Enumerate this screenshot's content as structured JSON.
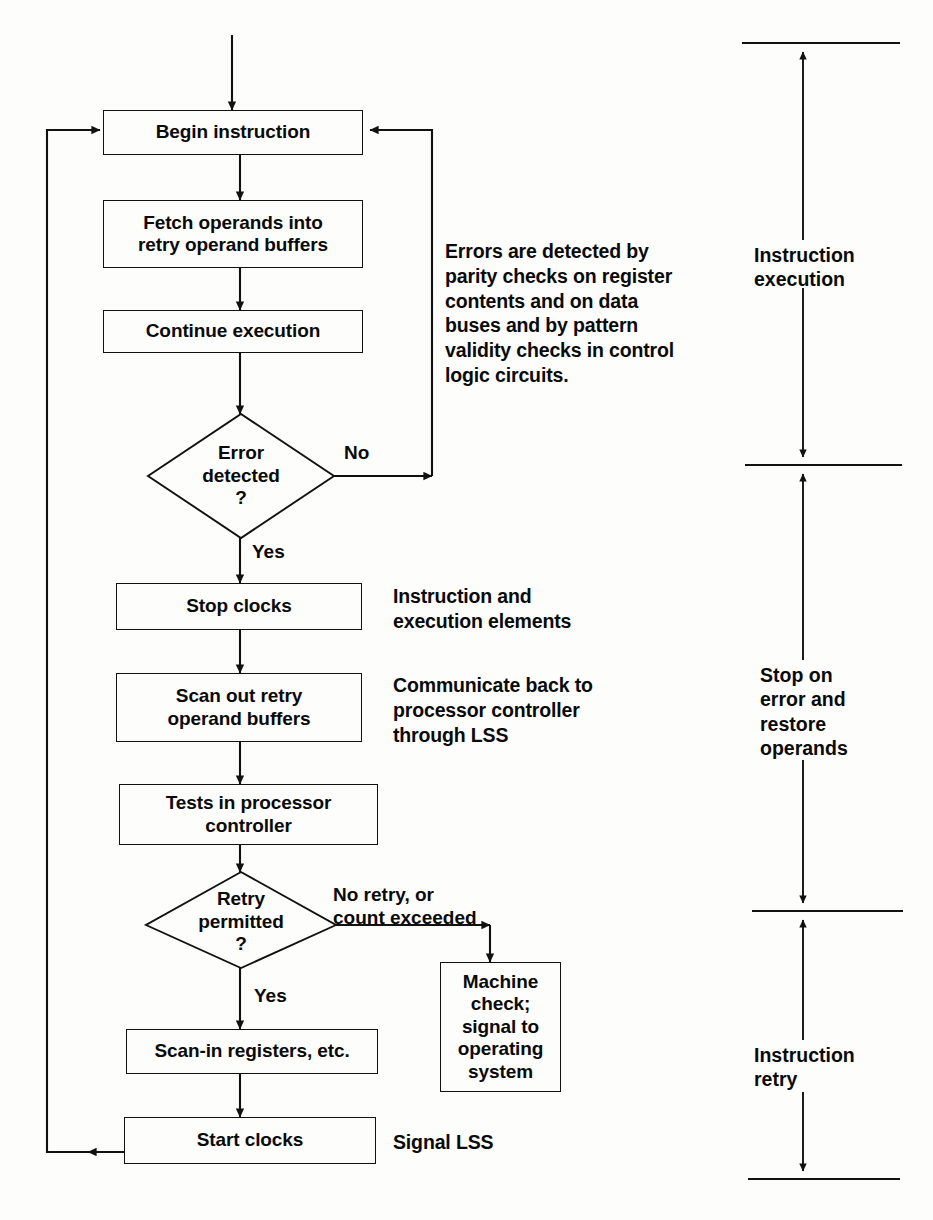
{
  "diagram": {
    "ink_color": "#111111",
    "background": "#fdfdfb"
  },
  "nodes": {
    "begin_instruction": "Begin instruction",
    "fetch_operands": "Fetch operands into\nretry operand buffers",
    "continue_execution": "Continue execution",
    "error_detected": "Error\ndetected\n?",
    "stop_clocks": "Stop clocks",
    "scan_out": "Scan out retry\noperand buffers",
    "tests_in_controller": "Tests in processor\ncontroller",
    "retry_permitted": "Retry\npermitted\n?",
    "machine_check": "Machine\ncheck;\nsignal to\noperating\nsystem",
    "scan_in": "Scan-in registers, etc.",
    "start_clocks": "Start clocks"
  },
  "edge_labels": {
    "error_no": "No",
    "error_yes": "Yes",
    "retry_no": "No retry, or\ncount exceeded",
    "retry_yes": "Yes"
  },
  "notes": {
    "errors_detected": "Errors are detected by\nparity checks on register\ncontents and on data\nbuses and by pattern\nvalidity checks in control\nlogic circuits.",
    "instruction_and_execution": "Instruction and\nexecution elements",
    "communicate_back": "Communicate back to\nprocessor controller\nthrough LSS",
    "signal_lss": "Signal LSS"
  },
  "phases": [
    {
      "label": "Instruction\nexecution"
    },
    {
      "label": "Stop on\nerror and\nrestore\noperands"
    },
    {
      "label": "Instruction\nretry"
    }
  ]
}
